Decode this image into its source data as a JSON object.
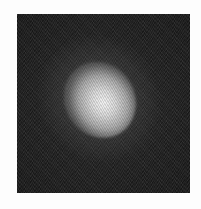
{
  "image": {
    "description": "Grayscale image of a single bright diffuse blob centered on a dark noisy square background",
    "colors": {
      "page_background": "#fdfdfd",
      "frame_background": "#1e1e1e",
      "blob_core": "#f2f2f2",
      "blob_edge": "#a8a8a8"
    },
    "frame": {
      "x": 17,
      "y": 14,
      "width": 173,
      "height": 179
    },
    "blob": {
      "center_x": 98,
      "center_y": 97,
      "orientation": "tilted upper-right to lower-left"
    }
  }
}
